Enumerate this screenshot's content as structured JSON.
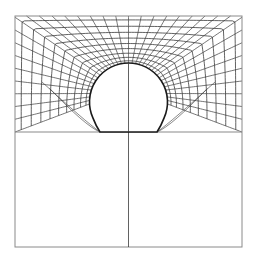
{
  "figure": {
    "colors": {
      "background": "#ffffff",
      "mesh_line": "#3a3a3a",
      "frame_line": "#8a8a8a",
      "circle_line": "#1a1a1a"
    },
    "frame": {
      "x0": 15,
      "y0": 16,
      "x1": 242,
      "y1": 247
    },
    "divider_y": 132,
    "centerline_x": 128.5,
    "circle": {
      "cx": 128.5,
      "cy": 102,
      "r": 39,
      "base_left_x": 100,
      "base_right_x": 157
    },
    "mesh": {
      "rings": 9,
      "radials": 36
    }
  }
}
